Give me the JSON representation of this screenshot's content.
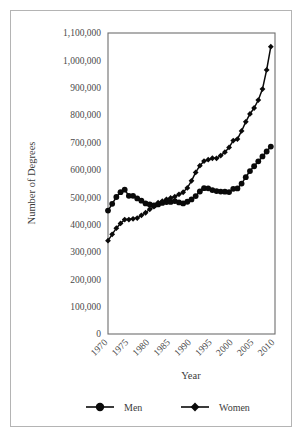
{
  "chart_data": {
    "type": "line",
    "title": "",
    "xlabel": "Year",
    "ylabel": "Number of Degrees",
    "xlim": [
      1970,
      2010
    ],
    "ylim": [
      0,
      1100000
    ],
    "grid": false,
    "legend_position": "bottom",
    "y_ticks": [
      0,
      100000,
      200000,
      300000,
      400000,
      500000,
      600000,
      700000,
      800000,
      900000,
      1000000,
      1100000
    ],
    "y_tick_labels": [
      "0",
      "100,000",
      "200,000",
      "300,000",
      "400,000",
      "500,000",
      "600,000",
      "700,000",
      "800,000",
      "900,000",
      "1,000,000",
      "1,100,000"
    ],
    "x_ticks": [
      1970,
      1975,
      1980,
      1985,
      1990,
      1995,
      2000,
      2005,
      2010
    ],
    "x_tick_labels": [
      "1970",
      "1975",
      "1980",
      "1985",
      "1990",
      "1995",
      "2000",
      "2005",
      "2010"
    ],
    "x": [
      1970,
      1971,
      1972,
      1973,
      1974,
      1975,
      1976,
      1977,
      1978,
      1979,
      1980,
      1981,
      1982,
      1983,
      1984,
      1985,
      1986,
      1987,
      1988,
      1989,
      1990,
      1991,
      1992,
      1993,
      1994,
      1995,
      1996,
      1997,
      1998,
      1999,
      2000,
      2001,
      2002,
      2003,
      2004,
      2005,
      2006,
      2007,
      2008,
      2009
    ],
    "series": [
      {
        "name": "Men",
        "marker": "circle",
        "color": "#0a0a0a",
        "values": [
          451097,
          475594,
          500590,
          518191,
          527313,
          504841,
          504925,
          495545,
          487347,
          477344,
          473611,
          469883,
          473364,
          479140,
          482319,
          482528,
          485923,
          480782,
          477203,
          483346,
          491696,
          504045,
          520811,
          532881,
          532422,
          526131,
          522454,
          520515,
          519956,
          518746,
          530367,
          531840,
          549816,
          573079,
          595425,
          613000,
          631000,
          649000,
          667000,
          685000
        ]
      },
      {
        "name": "Women",
        "marker": "diamond",
        "color": "#0a0a0a",
        "values": [
          341219,
          364133,
          386683,
          404171,
          418092,
          418092,
          420821,
          423476,
          433857,
          443123,
          455806,
          465257,
          479634,
          485581,
          491990,
          496949,
          501900,
          510500,
          518000,
          534000,
          559648,
          590493,
          615024,
          632063,
          637000,
          642338,
          642000,
          652000,
          664450,
          682000,
          707000,
          712331,
          742084,
          775424,
          804117,
          826000,
          855000,
          895000,
          965000,
          1050000
        ]
      }
    ]
  },
  "legend": {
    "items": [
      {
        "label": "Men",
        "marker": "circle"
      },
      {
        "label": "Women",
        "marker": "diamond"
      }
    ]
  },
  "axis_titles": {
    "x": "Year",
    "y": "Number of Degrees"
  }
}
